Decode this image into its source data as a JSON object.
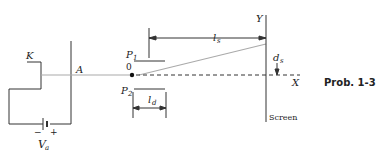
{
  "figure": {
    "caption": "Prob. 1-3",
    "labels": {
      "cathode": "K",
      "anode": "A",
      "plate_top": "P",
      "plate_top_sub": "1",
      "plate_bottom": "P",
      "plate_bottom_sub": "2",
      "origin": "0",
      "plate_length": "l",
      "plate_length_sub": "d",
      "screen_distance": "l",
      "screen_distance_sub": "s",
      "deflection": "d",
      "deflection_sub": "s",
      "y_axis": "Y",
      "x_axis": "X",
      "screen": "Screen",
      "voltage": "V",
      "voltage_sub": "a",
      "minus": "−",
      "plus": "+"
    }
  }
}
